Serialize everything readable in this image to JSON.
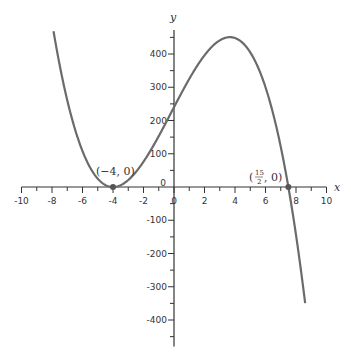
{
  "chart_data": {
    "type": "line",
    "title": "",
    "xlabel": "x",
    "ylabel": "y",
    "xlim": [
      -10,
      10
    ],
    "ylim": [
      -480,
      480
    ],
    "grid": false,
    "x_ticks": [
      -10,
      -8,
      -6,
      -4,
      -2,
      0,
      2,
      4,
      6,
      8,
      10
    ],
    "x_tick_labels": [
      "-10",
      "-8",
      "-6",
      "-4",
      "-2",
      "0",
      "2",
      "4",
      "6",
      "8",
      "10"
    ],
    "y_ticks": [
      -400,
      -300,
      -200,
      -100,
      0,
      100,
      200,
      300,
      400
    ],
    "y_tick_labels": [
      "-400",
      "-300",
      "-200",
      "-100",
      "0",
      "100",
      "200",
      "300",
      "400"
    ],
    "series": [
      {
        "name": "f(x) = 2(x+4)^2(15/2 - x)",
        "color": "#666666",
        "x": [
          -7.9,
          -7,
          -6,
          -5,
          -4,
          -3,
          -2,
          -1,
          0,
          1,
          2,
          3,
          3.67,
          4,
          5,
          6,
          7,
          7.5,
          8,
          8.6
        ],
        "values": [
          471,
          279,
          108,
          25,
          0,
          21,
          76,
          153,
          240,
          325,
          396,
          441,
          450,
          448,
          405,
          300,
          121,
          0,
          -144,
          -324
        ]
      }
    ],
    "annotations": [
      {
        "label": "(−4, 0)",
        "x": -4,
        "y": 0
      },
      {
        "label": "(15/2, 0)",
        "x": 7.5,
        "y": 0
      }
    ]
  },
  "labels": {
    "x_axis": "x",
    "y_axis": "y",
    "point_left": "(−4, 0)",
    "point_right_num": "15",
    "point_right_den": "2",
    "origin": "0"
  }
}
